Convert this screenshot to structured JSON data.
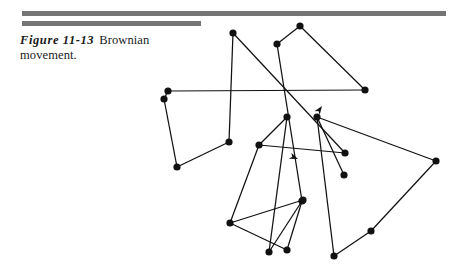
{
  "page": {
    "background": "#ffffff",
    "width": 460,
    "height": 272
  },
  "rules": {
    "color": "#757575",
    "top_rule": {
      "x": 22,
      "y": 11,
      "width": 424,
      "height": 5
    },
    "second_rule": {
      "x": 22,
      "y": 21,
      "width": 179,
      "height": 5
    }
  },
  "caption": {
    "figure_label": "Figure 11-13",
    "figure_text": "Brownian movement."
  },
  "figure": {
    "title": "Brownian movement",
    "ink_color": "#111111",
    "node_radius": 3.6,
    "stroke_width": 1.25,
    "nodes": [
      {
        "id": "n1",
        "x": 233,
        "y": 33
      },
      {
        "id": "n2",
        "x": 300,
        "y": 26
      },
      {
        "id": "n3",
        "x": 277,
        "y": 44
      },
      {
        "id": "n4",
        "x": 365,
        "y": 90
      },
      {
        "id": "n5",
        "x": 168,
        "y": 91
      },
      {
        "id": "n6",
        "x": 164,
        "y": 99
      },
      {
        "id": "n7",
        "x": 287,
        "y": 117
      },
      {
        "id": "n8",
        "x": 317,
        "y": 117
      },
      {
        "id": "n9",
        "x": 229,
        "y": 142
      },
      {
        "id": "n10",
        "x": 259,
        "y": 145
      },
      {
        "id": "n11",
        "x": 345,
        "y": 153
      },
      {
        "id": "n12",
        "x": 436,
        "y": 161
      },
      {
        "id": "n13",
        "x": 177,
        "y": 167
      },
      {
        "id": "n14",
        "x": 344,
        "y": 175
      },
      {
        "id": "n15",
        "x": 302,
        "y": 201
      },
      {
        "id": "n16",
        "x": 303,
        "y": 200
      },
      {
        "id": "n17",
        "x": 230,
        "y": 223
      },
      {
        "id": "n18",
        "x": 371,
        "y": 231
      },
      {
        "id": "n19",
        "x": 269,
        "y": 252
      },
      {
        "id": "n20",
        "x": 287,
        "y": 250
      },
      {
        "id": "n21",
        "x": 334,
        "y": 256
      }
    ],
    "arrows": [
      {
        "id": "arrow-up-left",
        "x": 322,
        "y": 106,
        "angle": -55
      },
      {
        "id": "arrow-right",
        "x": 298,
        "y": 159,
        "angle": 22
      }
    ],
    "segments": [
      [
        "n1",
        "n9"
      ],
      [
        "n1",
        "n11"
      ],
      [
        "n2",
        "n3"
      ],
      [
        "n2",
        "n4"
      ],
      [
        "n3",
        "n15"
      ],
      [
        "n4",
        "n5"
      ],
      [
        "n5",
        "n6"
      ],
      [
        "n6",
        "n13"
      ],
      [
        "n13",
        "n9"
      ],
      [
        "n7",
        "n19"
      ],
      [
        "n7",
        "n10"
      ],
      [
        "n8",
        "n14"
      ],
      [
        "n8",
        "n12"
      ],
      [
        "n8",
        "n21"
      ],
      [
        "n10",
        "n17"
      ],
      [
        "n10",
        "n11"
      ],
      [
        "n12",
        "n18"
      ],
      [
        "n15",
        "n19"
      ],
      [
        "n15",
        "n20"
      ],
      [
        "n16",
        "n17"
      ],
      [
        "n17",
        "n20"
      ],
      [
        "n18",
        "n21"
      ]
    ]
  }
}
